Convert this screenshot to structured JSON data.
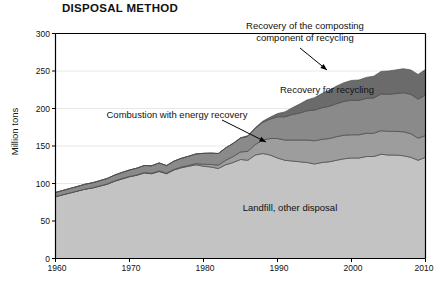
{
  "chart_data": {
    "type": "area",
    "title": "DISPOSAL METHOD",
    "xlabel": "",
    "ylabel": "Million tons",
    "ylim": [
      0,
      300
    ],
    "xlim": [
      1960,
      2010
    ],
    "yticks": [
      0,
      50,
      100,
      150,
      200,
      250,
      300
    ],
    "xticks": [
      1960,
      1970,
      1980,
      1990,
      2000,
      2010
    ],
    "grid": "horizontal-faint",
    "legend": "inline-annotations",
    "stacked": true,
    "x": [
      1960,
      1961,
      1962,
      1963,
      1964,
      1965,
      1966,
      1967,
      1968,
      1969,
      1970,
      1971,
      1972,
      1973,
      1974,
      1975,
      1976,
      1977,
      1978,
      1979,
      1980,
      1981,
      1982,
      1983,
      1984,
      1985,
      1986,
      1987,
      1988,
      1989,
      1990,
      1991,
      1992,
      1993,
      1994,
      1995,
      1996,
      1997,
      1998,
      1999,
      2000,
      2001,
      2002,
      2003,
      2004,
      2005,
      2006,
      2007,
      2008,
      2009,
      2010
    ],
    "series": [
      {
        "name": "Landfill, other disposal",
        "color": "#c3c3c3",
        "values": [
          82.5,
          85.0,
          87.5,
          90.0,
          92.5,
          94.0,
          96.5,
          99.0,
          103.0,
          106.0,
          109.0,
          111.0,
          114.0,
          113.0,
          116.0,
          113.0,
          118.0,
          121.0,
          123.0,
          125.0,
          123.0,
          122.0,
          120.0,
          125.0,
          128.0,
          132.0,
          131.0,
          138.0,
          140.0,
          138.0,
          134.0,
          131.0,
          130.0,
          129.0,
          128.0,
          126.0,
          128.0,
          129.0,
          131.0,
          133.0,
          134.0,
          134.0,
          136.0,
          136.0,
          139.0,
          138.0,
          138.0,
          137.0,
          135.0,
          131.0,
          135.0
        ]
      },
      {
        "name": "Combustion with energy recovery",
        "color": "#9d9d9d",
        "values": [
          0.0,
          0.0,
          0.0,
          0.0,
          0.0,
          0.2,
          0.3,
          0.4,
          0.5,
          0.6,
          0.4,
          0.5,
          0.6,
          0.7,
          0.8,
          0.7,
          0.8,
          1.0,
          1.2,
          1.5,
          2.7,
          3.5,
          4.5,
          6.0,
          8.0,
          10.0,
          12.0,
          14.0,
          18.0,
          22.0,
          26.0,
          27.0,
          28.0,
          29.0,
          30.0,
          31.0,
          31.0,
          31.0,
          31.5,
          31.5,
          31.0,
          31.0,
          31.0,
          31.0,
          31.5,
          31.5,
          31.5,
          32.0,
          31.5,
          29.5,
          29.0
        ]
      },
      {
        "name": "Recovery for recycling",
        "color": "#8a8a8a",
        "values": [
          5.6,
          5.8,
          6.0,
          6.2,
          6.6,
          6.8,
          7.0,
          7.4,
          7.8,
          8.2,
          8.6,
          9.0,
          9.4,
          10.0,
          10.6,
          10.2,
          11.0,
          11.6,
          12.2,
          13.0,
          14.5,
          15.0,
          15.5,
          16.5,
          17.5,
          18.5,
          20.0,
          21.5,
          23.5,
          26.0,
          29.0,
          31.0,
          34.0,
          36.0,
          39.0,
          41.0,
          42.0,
          43.0,
          44.0,
          45.0,
          46.0,
          46.0,
          46.5,
          47.0,
          49.0,
          49.5,
          50.5,
          52.0,
          52.5,
          52.0,
          54.0
        ]
      },
      {
        "name": "Recovery of the composting component of recycling",
        "color": "#6b6b6b",
        "values": [
          0.0,
          0.0,
          0.0,
          0.0,
          0.0,
          0.0,
          0.0,
          0.0,
          0.0,
          0.0,
          0.0,
          0.0,
          0.0,
          0.0,
          0.0,
          0.0,
          0.0,
          0.0,
          0.0,
          0.0,
          0.0,
          0.0,
          0.0,
          0.0,
          0.0,
          0.5,
          0.8,
          1.0,
          1.5,
          2.5,
          4.2,
          6.5,
          9.0,
          12.0,
          14.5,
          16.5,
          19.0,
          21.5,
          23.5,
          25.0,
          26.5,
          27.0,
          28.0,
          29.0,
          30.0,
          31.0,
          31.5,
          32.0,
          32.5,
          33.0,
          34.0
        ]
      }
    ],
    "annotations": [
      {
        "name": "composting-label",
        "text_lines": [
          "Recovery of the composting",
          "component of recycling"
        ],
        "x": 305,
        "y": 24,
        "has_arrow": true
      },
      {
        "name": "combustion-label",
        "text_lines": [
          "Combustion with energy recovery"
        ],
        "x": 177,
        "y": 110,
        "has_arrow": true
      },
      {
        "name": "recycling-label",
        "text_lines": [
          "Recovery for recycling"
        ],
        "x": 327,
        "y": 86,
        "has_arrow": false
      },
      {
        "name": "landfill-label",
        "text_lines": [
          "Landfill, other disposal"
        ],
        "x": 290,
        "y": 204,
        "has_arrow": false
      }
    ]
  },
  "axis": {
    "yticks": [
      "300",
      "250",
      "200",
      "150",
      "100",
      "50",
      "0"
    ],
    "xticks": [
      "1960",
      "1970",
      "1980",
      "1990",
      "2000",
      "2010"
    ],
    "ylabel": "Million tons"
  },
  "labels": {
    "title": "DISPOSAL METHOD",
    "composting_line1": "Recovery of the composting",
    "composting_line2": "component of recycling",
    "combustion": "Combustion with energy recovery",
    "recycling": "Recovery for recycling",
    "landfill": "Landfill, other disposal"
  },
  "colors": {
    "landfill": "#c3c3c3",
    "combustion": "#9d9d9d",
    "recycling": "#8a8a8a",
    "composting": "#6b6b6b",
    "axis": "#000000",
    "grid": "#e8e8e8",
    "text": "#111111",
    "background": "#ffffff"
  }
}
